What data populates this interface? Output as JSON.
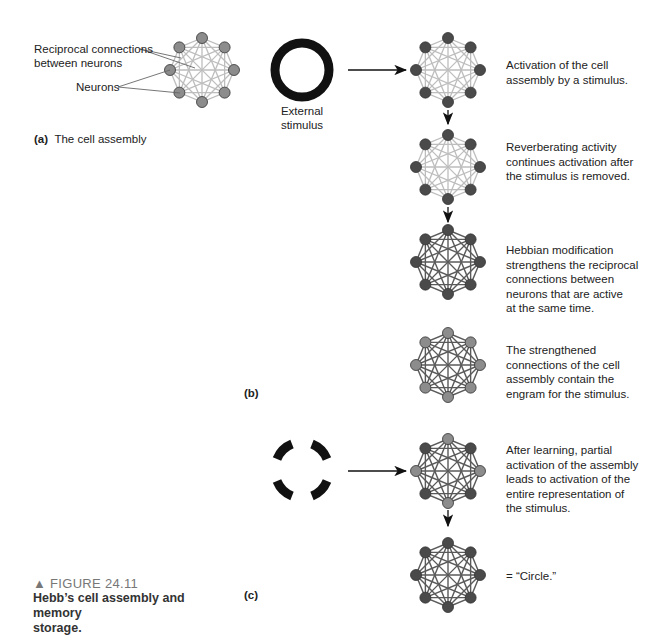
{
  "panel_a": {
    "label": "(a)",
    "title": "The cell assembly",
    "callout_connections": "Reciprocal connections\nbetween neurons",
    "callout_neurons": "Neurons"
  },
  "panel_b": {
    "label": "(b)",
    "stimulus_label": "External\nstimulus",
    "steps": [
      {
        "text": "Activation of the cell\nassembly by a stimulus."
      },
      {
        "text": "Reverberating activity\ncontinues activation after\nthe stimulus is removed."
      },
      {
        "text": "Hebbian modification\nstrengthens the reciprocal\nconnections between\nneurons that are active\nat the same time."
      },
      {
        "text": "The strengthened\nconnections of the cell\nassembly contain the\nengram for the stimulus."
      }
    ]
  },
  "panel_c": {
    "label": "(c)",
    "steps": [
      {
        "text": "After learning, partial\nactivation of the assembly\nleads to activation of the\nentire representation of\nthe stimulus."
      },
      {
        "text": "= “Circle.”"
      }
    ]
  },
  "caption": {
    "marker": "▲",
    "figure_number": "FIGURE 24.11",
    "title": "Hebb’s cell assembly and memory\nstorage."
  },
  "colors": {
    "active_node": "#4a4a4a",
    "inactive_node": "#8c8c8c",
    "weak_link": "#bdbdbd",
    "strong_link": "#5a5a5a",
    "stimulus": "#111111"
  }
}
